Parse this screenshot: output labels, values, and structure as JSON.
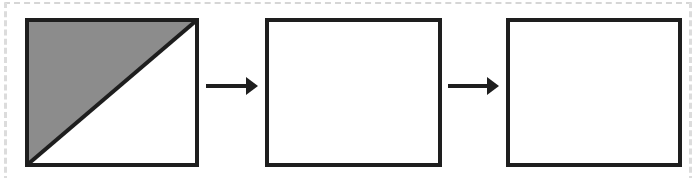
{
  "diagram": {
    "type": "sequence",
    "colors": {
      "stroke": "#1e1e1e",
      "shade": "#8c8c8c",
      "fill": "#ffffff",
      "frame": "#d6d6d6"
    },
    "boxes": [
      {
        "id": "box-1",
        "x": 27,
        "y": 20,
        "w": 170,
        "h": 145,
        "shaded": "upper-left-triangle"
      },
      {
        "id": "box-2",
        "x": 267,
        "y": 20,
        "w": 173,
        "h": 145,
        "shaded": "none"
      },
      {
        "id": "box-3",
        "x": 508,
        "y": 20,
        "w": 172,
        "h": 145,
        "shaded": "none"
      }
    ],
    "arrows": [
      {
        "id": "arrow-1",
        "from": "box-1",
        "to": "box-2",
        "x1": 206,
        "x2": 258,
        "y": 86
      },
      {
        "id": "arrow-2",
        "from": "box-2",
        "to": "box-3",
        "x1": 448,
        "x2": 499,
        "y": 86
      }
    ]
  }
}
